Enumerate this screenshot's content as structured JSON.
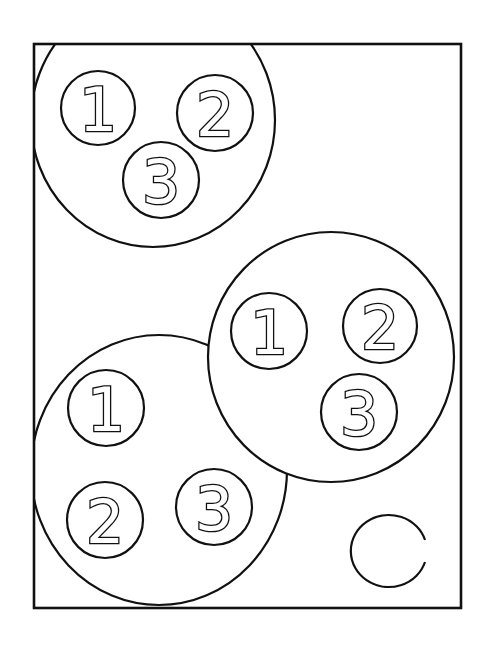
{
  "figure": {
    "width": 487,
    "height": 648,
    "background": "#ffffff",
    "ink": "#111111",
    "frame": {
      "x": 34,
      "y": 44,
      "width": 427,
      "height": 564
    }
  },
  "groups": [
    {
      "name": "group-top-left",
      "cx": 153,
      "cy": 120,
      "rx": 122,
      "ry": 127,
      "balls": [
        {
          "label": "1",
          "cx": 98,
          "cy": 108,
          "r": 37
        },
        {
          "label": "2",
          "cx": 215,
          "cy": 113,
          "r": 38
        },
        {
          "label": "3",
          "cx": 161,
          "cy": 180,
          "r": 38
        }
      ]
    },
    {
      "name": "group-right",
      "cx": 331,
      "cy": 357,
      "rx": 123,
      "ry": 125,
      "balls": [
        {
          "label": "1",
          "cx": 269,
          "cy": 331,
          "r": 38
        },
        {
          "label": "2",
          "cx": 380,
          "cy": 326,
          "r": 37
        },
        {
          "label": "3",
          "cx": 359,
          "cy": 412,
          "r": 38
        }
      ]
    },
    {
      "name": "group-bottom-left",
      "cx": 159,
      "cy": 470,
      "rx": 128,
      "ry": 135,
      "balls": [
        {
          "label": "1",
          "cx": 106,
          "cy": 408,
          "r": 38
        },
        {
          "label": "2",
          "cx": 105,
          "cy": 520,
          "r": 38
        },
        {
          "label": "3",
          "cx": 214,
          "cy": 507,
          "r": 38
        }
      ]
    }
  ],
  "empty_circle": {
    "cx": 388,
    "cy": 551,
    "rx": 38,
    "ry": 36
  },
  "labels": {
    "g0b0": "1",
    "g0b1": "2",
    "g0b2": "3",
    "g1b0": "1",
    "g1b1": "2",
    "g1b2": "3",
    "g2b0": "1",
    "g2b1": "2",
    "g2b2": "3"
  }
}
